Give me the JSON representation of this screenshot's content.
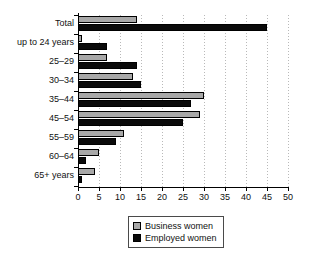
{
  "chart_data": {
    "type": "bar",
    "orientation": "horizontal",
    "title": "",
    "xlabel": "",
    "ylabel": "",
    "xlim": [
      0,
      50
    ],
    "xticks": [
      0,
      5,
      10,
      15,
      20,
      25,
      30,
      35,
      40,
      45,
      50
    ],
    "grid": true,
    "grid_axis": "x",
    "legend_position": "bottom-center",
    "categories": [
      "Total",
      "up to 24 years",
      "25–29",
      "30–34",
      "35–44",
      "45–54",
      "55–59",
      "60–64",
      "65+ years"
    ],
    "series": [
      {
        "name": "Business women",
        "color": "#a8a8a8",
        "values": [
          14,
          1,
          7,
          13,
          30,
          29,
          11,
          5,
          4
        ]
      },
      {
        "name": "Employed women",
        "color": "#0a0a0a",
        "values": [
          45,
          7,
          14,
          15,
          27,
          25,
          9,
          2,
          1
        ]
      }
    ]
  },
  "legend": {
    "items": [
      {
        "label": "Business women",
        "swatch": "business"
      },
      {
        "label": "Employed women",
        "swatch": "employed"
      }
    ]
  }
}
